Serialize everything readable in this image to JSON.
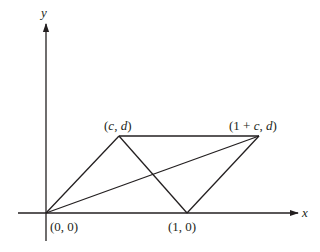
{
  "diagram": {
    "type": "parallelogram-coordinate-plot",
    "axes": {
      "x_label": "x",
      "y_label": "y"
    },
    "points": [
      {
        "id": "origin",
        "label": "(0, 0)",
        "px": [
          46,
          213
        ]
      },
      {
        "id": "c-d",
        "label": "(c, d)",
        "px": [
          119,
          136
        ]
      },
      {
        "id": "one-plus-c-d",
        "label": "(1 + c, d)",
        "px": [
          259,
          136
        ]
      },
      {
        "id": "one-zero",
        "label": "(1, 0)",
        "px": [
          187,
          213
        ]
      }
    ],
    "segments": [
      {
        "from": "origin",
        "to": "c-d"
      },
      {
        "from": "c-d",
        "to": "one-plus-c-d"
      },
      {
        "from": "c-d",
        "to": "one-zero"
      },
      {
        "from": "one-zero",
        "to": "one-plus-c-d"
      },
      {
        "from": "origin",
        "to": "one-plus-c-d"
      }
    ],
    "colors": {
      "ink": "#231f20",
      "background": "#ffffff"
    }
  }
}
